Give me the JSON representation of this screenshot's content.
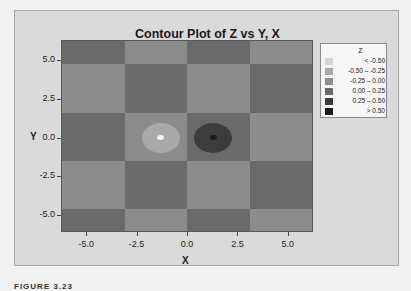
{
  "chart_data": {
    "type": "heatmap",
    "subtype": "contour",
    "title": "Contour Plot of Z vs Y, X",
    "xlabel": "X",
    "ylabel": "Y",
    "xlim": [
      -6.2,
      6.2
    ],
    "ylim": [
      -6.0,
      6.2
    ],
    "xticks": [
      "-5.0",
      "-2.5",
      "0.0",
      "2.5",
      "5.0"
    ],
    "yticks": [
      "5.0",
      "2.5",
      "0.0",
      "-2.5",
      "-5.0"
    ],
    "legend_title": "Z",
    "legend_position": "right",
    "levels": [
      {
        "range": "< -0.50",
        "color": "#d6d6d6"
      },
      {
        "range": "-0.50 – -0.25",
        "color": "#a9a9a9"
      },
      {
        "range": "-0.25 – 0.00",
        "color": "#8c8c8c"
      },
      {
        "range": "0.00 – 0.25",
        "color": "#6a6a6a"
      },
      {
        "range": "0.25 – 0.50",
        "color": "#3c3c3c"
      },
      {
        "range": "> 0.50",
        "color": "#1c1c1c"
      }
    ],
    "grid_pattern": {
      "columns_x_edges": [
        -6.2,
        -3.1,
        0.0,
        3.1,
        6.2
      ],
      "rows_y_edges": [
        6.2,
        4.7,
        1.6,
        -1.5,
        -4.6,
        -6.0
      ],
      "cells_level_index": [
        [
          3,
          2,
          3,
          2
        ],
        [
          2,
          3,
          2,
          3
        ],
        [
          3,
          2,
          3,
          2
        ],
        [
          2,
          3,
          2,
          3
        ],
        [
          3,
          2,
          3,
          2
        ]
      ]
    },
    "features": [
      {
        "type": "minimum",
        "x": -1.3,
        "y": 0.0,
        "levels": [
          "-0.50 – -0.25",
          "< -0.50"
        ]
      },
      {
        "type": "maximum",
        "x": 1.3,
        "y": 0.0,
        "levels": [
          "0.25 – 0.50",
          "> 0.50"
        ]
      }
    ]
  },
  "caption": "FIGURE 3.23"
}
